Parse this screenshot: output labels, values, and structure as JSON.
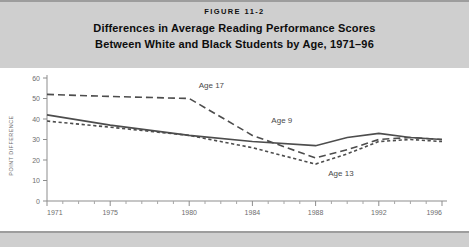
{
  "figure": {
    "number_label": "FIGURE 11-2",
    "title_line1": "Differences in Average Reading Performance Scores",
    "title_line2": "Between White and Black Students by Age, 1971–96"
  },
  "colors": {
    "band": "#cfcfcf",
    "line": "#4d4d4d",
    "axis": "#8d8d8d",
    "tick_label": "#6e6e6e",
    "title_text": "#0d0d0d"
  },
  "chart_data": {
    "type": "line",
    "title": "Differences in Average Reading Performance Scores Between White and Black Students by Age, 1971–96",
    "xlabel": "",
    "ylabel": "POINT DIFFERENCE",
    "xlim": [
      1971,
      1996
    ],
    "ylim": [
      0,
      60
    ],
    "grid": false,
    "legend": "inline-annotations",
    "yticks": [
      0,
      10,
      20,
      30,
      40,
      50,
      60
    ],
    "ytick_labels": [
      "0",
      "10",
      "20",
      "30",
      "40",
      "50",
      "60"
    ],
    "xticks_major": [
      1971,
      1975,
      1980,
      1984,
      1988,
      1992,
      1996
    ],
    "xtick_labels": [
      "1971",
      "1975",
      "1980",
      "1984",
      "1988",
      "1992",
      "1996"
    ],
    "xticks_minor": [
      1972,
      1973,
      1974,
      1976,
      1977,
      1978,
      1979,
      1981,
      1982,
      1983,
      1985,
      1986,
      1987,
      1989,
      1990,
      1991,
      1993,
      1994,
      1995
    ],
    "series": [
      {
        "name": "Age 17",
        "label": "Age 17",
        "style": "long-dashed",
        "x": [
          1971,
          1975,
          1980,
          1984,
          1988,
          1990,
          1992,
          1994,
          1996
        ],
        "values": [
          52,
          51,
          50,
          32,
          21,
          25,
          30,
          31,
          30
        ]
      },
      {
        "name": "Age 9",
        "label": "Age 9",
        "style": "solid",
        "x": [
          1971,
          1975,
          1980,
          1984,
          1988,
          1990,
          1992,
          1994,
          1996
        ],
        "values": [
          42,
          37,
          32,
          29,
          27,
          31,
          33,
          31,
          30
        ]
      },
      {
        "name": "Age 13",
        "label": "Age 13",
        "style": "short-dashed",
        "x": [
          1971,
          1975,
          1980,
          1984,
          1988,
          1990,
          1992,
          1994,
          1996
        ],
        "values": [
          39,
          36,
          32,
          26,
          18,
          23,
          29,
          30,
          29
        ]
      }
    ],
    "annotations": [
      {
        "text": "Age 17",
        "x": 1980.6,
        "y": 55
      },
      {
        "text": "Age 9",
        "x": 1985.2,
        "y": 38
      },
      {
        "text": "Age 13",
        "x": 1988.8,
        "y": 12
      }
    ]
  }
}
